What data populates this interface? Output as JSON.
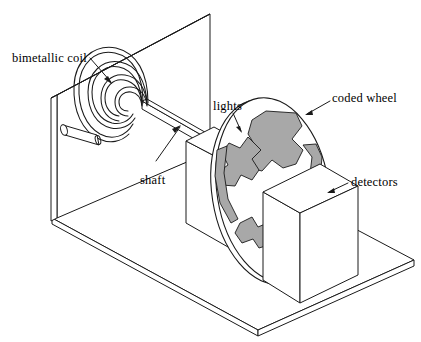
{
  "figure": {
    "kind": "technical-line-diagram",
    "background_color": "#ffffff",
    "line_color": "#1a1a1a",
    "shade_color": "#a8a8a8"
  },
  "labels": {
    "bimetallic_coil": "bimetallic coil",
    "shaft": "shaft",
    "lights": "lights",
    "coded_wheel": "coded wheel",
    "detectors": "detectors"
  },
  "parts": {
    "back_panel": "back panel",
    "base_plate": "base plate",
    "coil": "bimetallic spiral coil",
    "coil_anchor": "coil anchor pin",
    "shaft": "shaft",
    "lights_box": "lights housing",
    "coded_wheel": "coded wheel disc",
    "detectors_box": "detectors housing"
  }
}
